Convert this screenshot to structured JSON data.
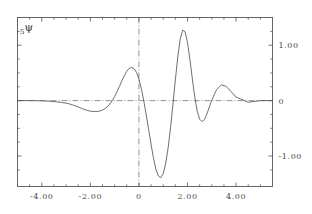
{
  "figure": {
    "curve_label_sub": "5",
    "curve_label_symbol": "ψ",
    "background_color": "#ffffff",
    "frame_color": "#555555",
    "curve_color": "#555555",
    "axis_line_color": "#777777"
  },
  "chart_data": {
    "type": "line",
    "title": "",
    "subtitle": "",
    "xlabel": "",
    "ylabel": "",
    "annotations": [
      {
        "text": "₅ψ",
        "x": -4.4,
        "y": 1.22
      }
    ],
    "grid": false,
    "legend": "none",
    "xlim": [
      -5.0,
      5.5
    ],
    "ylim": [
      -1.55,
      1.5
    ],
    "xticks": [
      -4.0,
      -2.0,
      0.0,
      2.0,
      4.0
    ],
    "xtick_labels": [
      "-4.00",
      "-2.00",
      "0",
      "2.00",
      "4.00"
    ],
    "xticks_minor": [
      -4.5,
      -3.5,
      -3.0,
      -2.5,
      -1.5,
      -1.0,
      -0.5,
      0.5,
      1.0,
      1.5,
      2.5,
      3.0,
      3.5,
      4.5,
      5.0
    ],
    "yticks": [
      -1.0,
      0.0,
      1.0
    ],
    "ytick_labels": [
      "-1.00",
      "0",
      "1.00"
    ],
    "yticks_minor": [
      -1.25,
      -0.75,
      -0.5,
      -0.25,
      0.25,
      0.5,
      0.75,
      1.25
    ],
    "zero_horizontal_line": 0.0,
    "zero_vertical_line": 0.0,
    "zero_lines_style": "dash-dot",
    "series": [
      {
        "name": "₅ψ",
        "x": [
          -5.0,
          -4.8,
          -4.6,
          -4.4,
          -4.2,
          -4.0,
          -3.8,
          -3.6,
          -3.4,
          -3.2,
          -3.0,
          -2.9,
          -2.8,
          -2.7,
          -2.6,
          -2.5,
          -2.4,
          -2.3,
          -2.2,
          -2.1,
          -2.0,
          -1.9,
          -1.8,
          -1.7,
          -1.6,
          -1.5,
          -1.4,
          -1.3,
          -1.2,
          -1.1,
          -1.0,
          -0.9,
          -0.8,
          -0.7,
          -0.6,
          -0.5,
          -0.4,
          -0.3,
          -0.2,
          -0.1,
          0.0,
          0.1,
          0.2,
          0.3,
          0.4,
          0.5,
          0.6,
          0.7,
          0.8,
          0.9,
          1.0,
          1.1,
          1.2,
          1.3,
          1.4,
          1.5,
          1.6,
          1.7,
          1.8,
          1.9,
          2.0,
          2.1,
          2.2,
          2.3,
          2.4,
          2.5,
          2.6,
          2.7,
          2.8,
          2.9,
          3.0,
          3.2,
          3.4,
          3.6,
          3.8,
          4.0,
          4.5,
          5.0,
          5.5
        ],
        "y": [
          0.0,
          0.0,
          0.0,
          0.0,
          -0.002,
          -0.004,
          -0.008,
          -0.014,
          -0.022,
          -0.032,
          -0.045,
          -0.055,
          -0.068,
          -0.082,
          -0.098,
          -0.115,
          -0.132,
          -0.15,
          -0.166,
          -0.18,
          -0.19,
          -0.196,
          -0.198,
          -0.195,
          -0.186,
          -0.17,
          -0.145,
          -0.11,
          -0.062,
          0.0,
          0.075,
          0.162,
          0.258,
          0.358,
          0.452,
          0.53,
          0.582,
          0.6,
          0.578,
          0.51,
          0.39,
          0.215,
          -0.005,
          -0.255,
          -0.52,
          -0.79,
          -1.04,
          -1.24,
          -1.36,
          -1.39,
          -1.32,
          -1.14,
          -0.86,
          -0.49,
          -0.07,
          0.375,
          0.79,
          1.11,
          1.27,
          1.245,
          1.05,
          0.74,
          0.39,
          0.06,
          -0.19,
          -0.335,
          -0.38,
          -0.34,
          -0.24,
          -0.115,
          0.01,
          0.2,
          0.285,
          0.255,
          0.16,
          0.065,
          -0.03,
          0.0,
          0.0
        ]
      }
    ]
  }
}
